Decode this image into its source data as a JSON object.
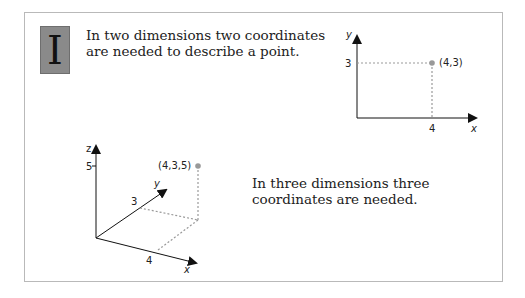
{
  "badge": {
    "letter": "I"
  },
  "text_2d": "In two dimensions two coordinates are needed to describe a point.",
  "text_3d": "In three dimensions three coordinates are needed.",
  "diagram_2d": {
    "x_axis_label": "x",
    "y_axis_label": "y",
    "x_tick": "4",
    "y_tick": "3",
    "point_label": "(4,3)"
  },
  "diagram_3d": {
    "x_axis_label": "x",
    "y_axis_label": "y",
    "z_axis_label": "z",
    "x_tick": "4",
    "y_tick": "3",
    "z_tick": "5",
    "point_label": "(4,3,5)"
  },
  "colors": {
    "point": "#999999",
    "dashed": "#9a9a9a",
    "axis": "#111111",
    "badge": "#8a8a8a"
  }
}
